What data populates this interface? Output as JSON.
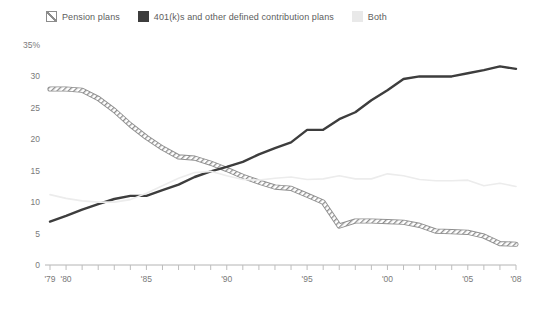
{
  "legend": {
    "items": [
      {
        "label": "Pension plans",
        "swatch": "hatch-swatch-icon",
        "color": "#8c8c8c"
      },
      {
        "label": "401(k)s and other defined contribution plans",
        "swatch": "solid-dark-swatch-icon",
        "color": "#3d3d3d"
      },
      {
        "label": "Both",
        "swatch": "light-gray-swatch-icon",
        "color": "#e9e9e9"
      }
    ]
  },
  "chart_data": {
    "type": "line",
    "title": "",
    "subtitle": "",
    "xlabel": "",
    "ylabel": "",
    "ylim": [
      0,
      35
    ],
    "yticks": [
      0,
      5,
      10,
      15,
      20,
      25,
      30,
      35
    ],
    "ytick_labels": [
      "0",
      "5",
      "10",
      "15",
      "20",
      "25",
      "30",
      "35%"
    ],
    "xlim": [
      1979,
      2008
    ],
    "xticks": [
      1979,
      1980,
      1985,
      1990,
      1995,
      2000,
      2005,
      2008
    ],
    "xtick_labels": [
      "'79",
      "'80",
      "'85",
      "'90",
      "'95",
      "'00",
      "'05",
      "'08"
    ],
    "grid": false,
    "legend_position": "top-left",
    "x": [
      1979,
      1980,
      1981,
      1982,
      1983,
      1984,
      1985,
      1986,
      1987,
      1988,
      1989,
      1990,
      1991,
      1992,
      1993,
      1994,
      1995,
      1996,
      1997,
      1998,
      1999,
      2000,
      2001,
      2002,
      2003,
      2004,
      2005,
      2006,
      2007,
      2008
    ],
    "series": [
      {
        "name": "Pension plans",
        "color": "#8c8c8c",
        "style": "hatched",
        "values": [
          28.0,
          28.0,
          27.8,
          26.5,
          24.6,
          22.3,
          20.3,
          18.6,
          17.2,
          17.0,
          16.2,
          15.2,
          14.1,
          13.2,
          12.4,
          12.2,
          11.1,
          10.0,
          6.2,
          7.0,
          7.0,
          6.9,
          6.8,
          6.3,
          5.4,
          5.3,
          5.2,
          4.6,
          3.4,
          3.3
        ]
      },
      {
        "name": "401(k)s and other defined contribution plans",
        "color": "#3d3d3d",
        "style": "solid",
        "values": [
          6.9,
          7.8,
          8.8,
          9.7,
          10.5,
          11.0,
          11.0,
          11.9,
          12.8,
          14.0,
          14.9,
          15.6,
          16.4,
          17.6,
          18.6,
          19.5,
          21.5,
          21.5,
          23.2,
          24.3,
          26.2,
          27.8,
          29.6,
          30.0,
          30.0,
          30.0,
          30.5,
          31.0,
          31.6,
          31.2
        ]
      },
      {
        "name": "Both",
        "color": "#ececec",
        "style": "solid-light",
        "values": [
          11.2,
          10.6,
          10.2,
          10.0,
          10.0,
          10.4,
          11.4,
          12.6,
          13.8,
          14.7,
          14.9,
          14.2,
          13.6,
          13.5,
          13.8,
          14.0,
          13.6,
          13.7,
          14.2,
          13.7,
          13.7,
          14.5,
          14.2,
          13.6,
          13.4,
          13.4,
          13.5,
          12.6,
          13.0,
          12.5
        ]
      }
    ]
  }
}
